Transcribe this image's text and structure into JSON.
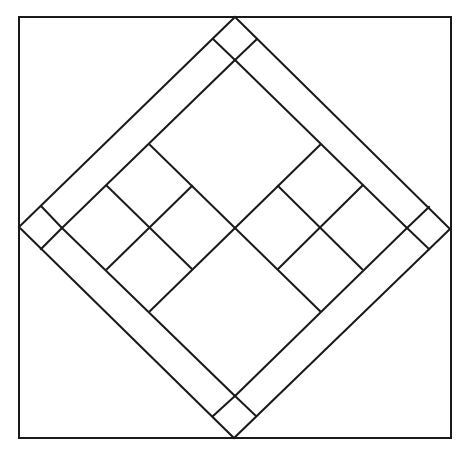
{
  "diagram": {
    "type": "quilt-block-line-drawing",
    "stroke_color": "#1a1a1a",
    "background": "#ffffff",
    "outer_square": {
      "x1": 19,
      "y1": 17,
      "x2": 451,
      "y2": 438
    },
    "outer_diamond": {
      "top": [
        235,
        17
      ],
      "right": [
        450,
        229
      ],
      "bottom": [
        234,
        438
      ],
      "left": [
        19,
        227
      ]
    },
    "inner_diamond": {
      "top": [
        235,
        60
      ],
      "right": [
        407,
        228
      ],
      "bottom": [
        235,
        396
      ],
      "left": [
        62,
        228
      ]
    },
    "corner_squares": [
      "top",
      "right",
      "bottom",
      "left"
    ],
    "four_patches": [
      {
        "name": "left-four-patch",
        "center": [
          150,
          228
        ]
      },
      {
        "name": "right-four-patch",
        "center": [
          320,
          228
        ]
      }
    ],
    "large_squares": [
      "top-large-square",
      "bottom-large-square"
    ]
  }
}
